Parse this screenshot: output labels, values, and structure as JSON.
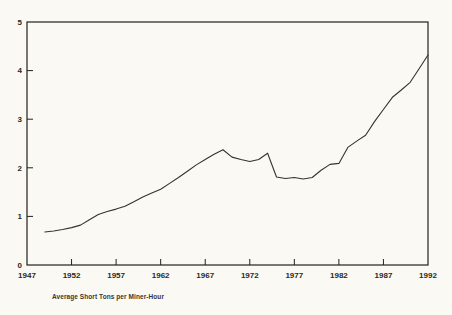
{
  "page": {
    "background_color": "#fbf9f4",
    "frame_color": "#23211d",
    "text_color": "#2b2925"
  },
  "chart_data": {
    "type": "line",
    "title": "",
    "caption": "Average Short Tons per Miner-Hour",
    "xlabel": "",
    "ylabel": "",
    "xlim": [
      1947,
      1992
    ],
    "ylim": [
      0,
      5
    ],
    "x_ticks": [
      1947,
      1952,
      1957,
      1962,
      1967,
      1972,
      1977,
      1982,
      1987,
      1992
    ],
    "y_ticks": [
      0,
      1,
      2,
      3,
      4,
      5
    ],
    "grid": false,
    "legend": "none",
    "line_color": "#35332e",
    "series": [
      {
        "name": "Average short tons per miner-hour",
        "x": [
          1949,
          1950,
          1951,
          1952,
          1953,
          1954,
          1955,
          1956,
          1957,
          1958,
          1959,
          1960,
          1961,
          1962,
          1963,
          1964,
          1965,
          1966,
          1967,
          1968,
          1969,
          1970,
          1971,
          1972,
          1973,
          1974,
          1975,
          1976,
          1977,
          1978,
          1979,
          1980,
          1981,
          1982,
          1983,
          1984,
          1985,
          1986,
          1987,
          1988,
          1989,
          1990,
          1991,
          1992
        ],
        "values": [
          0.68,
          0.7,
          0.73,
          0.77,
          0.82,
          0.93,
          1.04,
          1.1,
          1.15,
          1.21,
          1.3,
          1.4,
          1.48,
          1.56,
          1.68,
          1.8,
          1.93,
          2.06,
          2.17,
          2.28,
          2.37,
          2.22,
          2.17,
          2.13,
          2.17,
          2.3,
          1.81,
          1.78,
          1.8,
          1.77,
          1.8,
          1.95,
          2.07,
          2.09,
          2.42,
          2.55,
          2.67,
          2.95,
          3.2,
          3.45,
          3.6,
          3.76,
          4.04,
          4.32
        ]
      }
    ]
  }
}
